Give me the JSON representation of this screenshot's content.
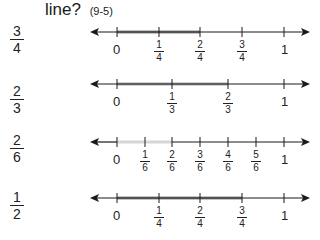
{
  "header": {
    "text": "line?",
    "code": "(9-5)"
  },
  "colors": {
    "line": "#1a1a1a",
    "shade": "#8a8a8a",
    "shade_light": "#d0d0d0"
  },
  "rows": [
    {
      "question": {
        "n": "3",
        "d": "4"
      },
      "ticks": [
        {
          "label": "0"
        },
        {
          "n": "1",
          "d": "4"
        },
        {
          "n": "2",
          "d": "4"
        },
        {
          "n": "3",
          "d": "4"
        },
        {
          "label": "1"
        }
      ],
      "shaded_to": "2/4"
    },
    {
      "question": {
        "n": "2",
        "d": "3"
      },
      "ticks": [
        {
          "label": "0"
        },
        {
          "n": "1",
          "d": "3"
        },
        {
          "n": "2",
          "d": "3"
        },
        {
          "label": "1"
        }
      ],
      "shaded_to": "2/3"
    },
    {
      "question": {
        "n": "2",
        "d": "6"
      },
      "ticks": [
        {
          "label": "0"
        },
        {
          "n": "1",
          "d": "6"
        },
        {
          "n": "2",
          "d": "6"
        },
        {
          "n": "3",
          "d": "6"
        },
        {
          "n": "4",
          "d": "6"
        },
        {
          "n": "5",
          "d": "6"
        },
        {
          "label": "1"
        }
      ],
      "shaded_to": "2/6"
    },
    {
      "question": {
        "n": "1",
        "d": "2"
      },
      "ticks": [
        {
          "label": "0"
        },
        {
          "n": "1",
          "d": "4"
        },
        {
          "n": "2",
          "d": "4"
        },
        {
          "n": "3",
          "d": "4"
        },
        {
          "label": "1"
        }
      ],
      "shaded_to": "3/4"
    }
  ]
}
